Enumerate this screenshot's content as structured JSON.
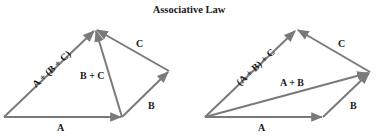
{
  "title": "Associative Law",
  "colors": {
    "arrow": "#7a7a7a",
    "text": "#1a1a1a",
    "background": "#ffffff"
  },
  "left_diagram": {
    "caption": "A + (B + C)",
    "vectors": [
      {
        "name": "A",
        "label": "A"
      },
      {
        "name": "B",
        "label": "B"
      },
      {
        "name": "C",
        "label": "C"
      },
      {
        "name": "B+C",
        "label": "B + C"
      },
      {
        "name": "A+(B+C)",
        "label": "A + (B + C)"
      }
    ]
  },
  "right_diagram": {
    "caption": "(A + B) + C",
    "vectors": [
      {
        "name": "A",
        "label": "A"
      },
      {
        "name": "B",
        "label": "B"
      },
      {
        "name": "C",
        "label": "C"
      },
      {
        "name": "A+B",
        "label": "A + B"
      },
      {
        "name": "(A+B)+C",
        "label": "(A + B) + C"
      }
    ]
  }
}
